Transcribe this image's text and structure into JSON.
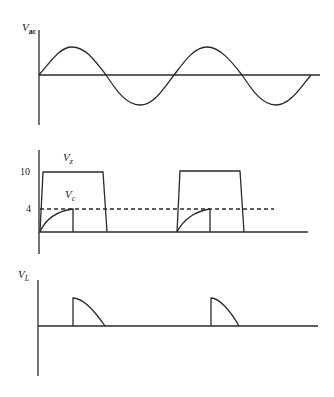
{
  "panels": [
    {
      "id": "vac",
      "ylabel_main": "V",
      "ylabel_sub": "ac",
      "description": "AC sinusoidal input voltage"
    },
    {
      "id": "vz_vc",
      "label_vz_main": "V",
      "label_vz_sub": "z",
      "label_vc_main": "V",
      "label_vc_sub": "c",
      "tick_10": "10",
      "tick_4": "4",
      "description": "Zener voltage clipped at 10 and capacitor voltage charging to 4"
    },
    {
      "id": "vl",
      "ylabel_main": "V",
      "ylabel_sub": "L",
      "description": "Load voltage pulses"
    }
  ],
  "colors": {
    "stroke": "#2a2a2a",
    "background": "#ffffff"
  }
}
